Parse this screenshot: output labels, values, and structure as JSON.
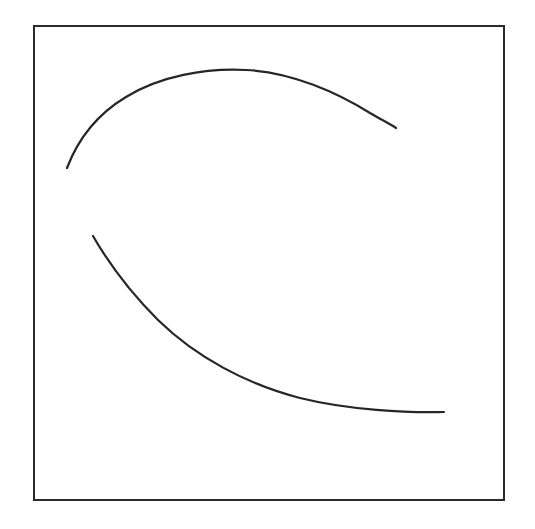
{
  "figure": {
    "canvas": {
      "width": 535,
      "height": 529,
      "background": "#ffffff"
    },
    "frame": {
      "name": "border-frame",
      "x": 34,
      "y": 26,
      "width": 470,
      "height": 474,
      "stroke_color": "#2b2b2b",
      "stroke_width": 2,
      "fill": "#ffffff"
    },
    "strokes": {
      "color": "#262626",
      "width": 2.2
    },
    "arcs": [
      {
        "name": "upper-arc",
        "label": "Upper arc",
        "path": "M 67 168 C 78 139 96 115 126 97 C 160 76 205 68 246 70 C 292 72 338 93 370 113 C 382 120 390 124 396 128",
        "start_point": [
          67,
          168
        ],
        "apex_point": [
          246,
          69
        ],
        "end_point": [
          396,
          128
        ],
        "stroke_color": "#262626",
        "stroke_width": 2.2
      },
      {
        "name": "lower-arc",
        "label": "Lower arc",
        "path": "M 93 236 C 108 262 130 292 158 320 C 196 357 246 384 300 398 C 348 410 408 413 444 412",
        "start_point": [
          93,
          236
        ],
        "end_point": [
          444,
          412
        ],
        "stroke_color": "#262626",
        "stroke_width": 2.2
      }
    ]
  }
}
